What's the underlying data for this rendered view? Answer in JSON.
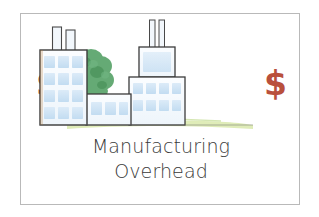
{
  "card": {
    "border_color": "#b9b9b9",
    "background": "#ffffff"
  },
  "caption": {
    "line1": "Manufacturing",
    "line2": "Overhead",
    "color": "#3a3a3a"
  },
  "money": {
    "left_symbol": "$",
    "right_symbol": "$",
    "color": "#b9503c"
  },
  "illustration": {
    "name": "factory-illustration",
    "alt": "Hand drawn factory buildings with smokestacks, a tree and grass",
    "colors": {
      "building_fill": "#f4f8fc",
      "building_outline": "#3c3c3c",
      "window_fill": "#cfe4f5",
      "stack_fill": "#eef4fa",
      "tree_foliage": "#4f9a5e",
      "tree_trunk": "#8a5a33",
      "grass": "#d4e5a8"
    },
    "elements": [
      {
        "name": "tree",
        "label": "tree"
      },
      {
        "name": "left-building",
        "label": "left building",
        "windows_rows": 4,
        "windows_cols": 3,
        "smokestacks": 2
      },
      {
        "name": "middle-building",
        "label": "middle building",
        "windows_rows": 1,
        "windows_cols": 3,
        "smokestacks": 0
      },
      {
        "name": "right-building",
        "label": "right building",
        "windows_rows": 2,
        "windows_cols": 4,
        "smokestacks": 2
      },
      {
        "name": "grass-strip",
        "label": "grass"
      }
    ]
  }
}
